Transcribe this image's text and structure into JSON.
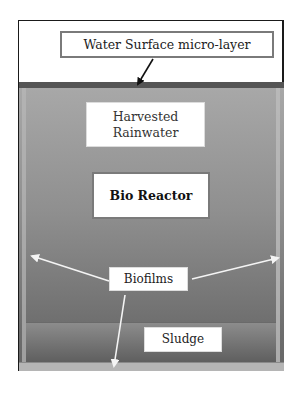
{
  "diagram": {
    "type": "rainwater tank bioreactor schematic",
    "labels": {
      "surface": "Water Surface micro-layer",
      "rainwater_line1": "Harvested",
      "rainwater_line2": "Rainwater",
      "bioreactor": "Bio Reactor",
      "biofilms": "Biofilms",
      "sludge": "Sludge"
    },
    "arrows": [
      {
        "from": "surface",
        "to": "tank-top-surface",
        "color": "#111111"
      },
      {
        "from": "biofilms",
        "to": "left-wall",
        "color": "#f2f2f2"
      },
      {
        "from": "biofilms",
        "to": "right-wall",
        "color": "#f2f2f2"
      },
      {
        "from": "biofilms",
        "to": "tank-floor",
        "color": "#f2f2f2"
      }
    ],
    "colors": {
      "tank_fill": "#8f8f8f",
      "tank_surface_line": "#555555",
      "sludge_fill": "#707070",
      "box_border": "#7a7a7a"
    }
  }
}
